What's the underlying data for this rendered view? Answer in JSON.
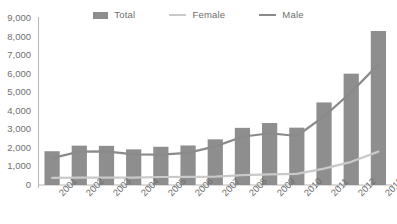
{
  "chart_data": {
    "type": "bar",
    "title": "",
    "xlabel": "",
    "ylabel": "",
    "grid": false,
    "legend_position": "top-center",
    "categories": [
      "2001",
      "2002",
      "2003",
      "2004",
      "2005",
      "2006",
      "2007",
      "2008",
      "2009",
      "2010",
      "2011",
      "2012",
      "2013"
    ],
    "ylim": [
      0,
      9000
    ],
    "yticks": [
      0,
      1000,
      2000,
      3000,
      4000,
      5000,
      6000,
      7000,
      8000,
      9000
    ],
    "ytick_labels": [
      "0",
      "1,000",
      "2,000",
      "3,000",
      "4,000",
      "5,000",
      "6,000",
      "7,000",
      "8,000",
      "9,000"
    ],
    "series": [
      {
        "name": "Total",
        "render": "bar",
        "color": "#8e8e8e",
        "values": [
          1820,
          2120,
          2110,
          1920,
          2060,
          2130,
          2460,
          3080,
          3340,
          3090,
          4450,
          6000,
          8300
        ]
      },
      {
        "name": "Female",
        "render": "line",
        "color": "#c9c9c9",
        "values": [
          380,
          400,
          400,
          400,
          430,
          440,
          450,
          530,
          570,
          600,
          880,
          1250,
          1800
        ]
      },
      {
        "name": "Male",
        "render": "line",
        "color": "#8a8a8a",
        "values": [
          1450,
          1800,
          1810,
          1650,
          1640,
          1730,
          2080,
          2600,
          2790,
          2640,
          3700,
          5000,
          6500
        ]
      }
    ]
  },
  "legend": {
    "items": [
      {
        "label": "Total",
        "marker": "bar-swatch",
        "color": "#8e8e8e"
      },
      {
        "label": "Female",
        "marker": "line-swatch",
        "color": "#c9c9c9"
      },
      {
        "label": "Male",
        "marker": "line-swatch",
        "color": "#8a8a8a"
      }
    ]
  },
  "axes": {
    "y_labels": [
      "9,000",
      "8,000",
      "7,000",
      "6,000",
      "5,000",
      "4,000",
      "3,000",
      "2,000",
      "1,000",
      "0"
    ],
    "x_labels": [
      "2001",
      "2002",
      "2003",
      "2004",
      "2005",
      "2006",
      "2007",
      "2008",
      "2009",
      "2010",
      "2011",
      "2012",
      "2013"
    ]
  },
  "colors": {
    "bar": "#8e8e8e",
    "female_line": "#c9c9c9",
    "male_line": "#8a8a8a",
    "axis": "#b8b8b8",
    "text": "#6f6f6f",
    "background": "#ffffff"
  }
}
